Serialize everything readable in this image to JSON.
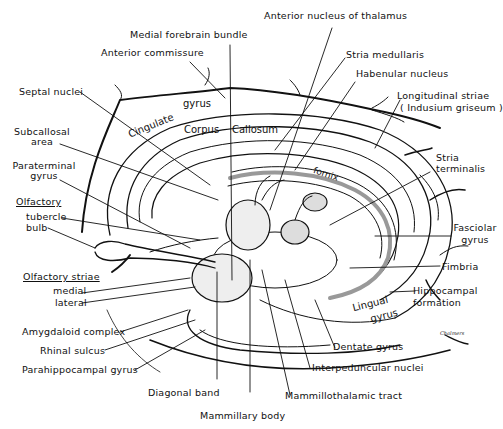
{
  "diagram": {
    "labels_top": {
      "medial_forebrain_bundle": "Medial forebrain bundle",
      "anterior_commissure": "Anterior commissure",
      "anterior_nucleus_thalamus": "Anterior nucleus of thalamus",
      "stria_medullaris": "Stria medullaris",
      "habenular_nucleus": "Habenular nucleus",
      "longitudinal_striae": "Longitudinal striae",
      "indusium_griseum": "( Indusium griseum )"
    },
    "labels_left": {
      "septal_nuclei": "Septal nuclei",
      "subcallosal_1": "Subcallosal",
      "subcallosal_2": "area",
      "paraterminal_1": "Paraterminal",
      "paraterminal_2": "gyrus",
      "olfactory": "Olfactory",
      "tubercle": "tubercle",
      "bulb": "bulb",
      "olfactory_striae": "Olfactory striae",
      "medial": "medial",
      "lateral": "lateral",
      "amygdaloid": "Amygdaloid complex",
      "rhinal": "Rhinal sulcus",
      "parahippocampal": "Parahippocampal gyrus"
    },
    "labels_right": {
      "stria_terminalis_1": "Stria",
      "stria_terminalis_2": "terminalis",
      "fasciolar_1": "Fasciolar",
      "fasciolar_2": "gyrus",
      "fimbria": "Fimbria",
      "hippocampal_1": "Hippocampal",
      "hippocampal_2": "formation"
    },
    "labels_bottom": {
      "dentate": "Dentate gyrus",
      "interpeduncular": "Interpeduncular nuclei",
      "mammillothalamic": "Mammillothalamic tract",
      "diagonal": "Diagonal band",
      "mammillary": "Mammillary body"
    },
    "labels_inner": {
      "cingulate": "Cingulate",
      "gyrus": "gyrus",
      "corpus": "Corpus",
      "callosum": "Callosum",
      "fornix": "fornix",
      "lingual_1": "Lingual",
      "lingual_2": "gyrus"
    },
    "signature": "Chalmers",
    "colors": {
      "ink": "#111111",
      "background": "#ffffff",
      "stipple": "#555555"
    }
  }
}
